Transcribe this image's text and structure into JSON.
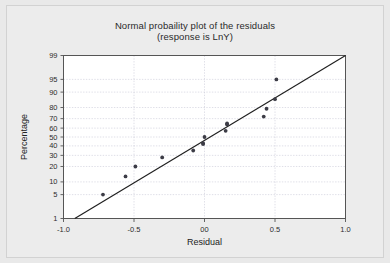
{
  "figure": {
    "background_color": "#e9e9e9",
    "plot_background_color": "#ffffff",
    "frame_color": "#555555",
    "grid_color": "#c9c9d6",
    "marker_color": "#3c3c46",
    "line_color": "#1f1f1f"
  },
  "chart_data": {
    "type": "scatter",
    "title": "Normal probaility plot of the residuals",
    "subtitle": "(response is LnY)",
    "xlabel": "Residual",
    "ylabel": "Percentage",
    "xlim": [
      -1.0,
      1.0
    ],
    "ylim": [
      1,
      99
    ],
    "yscale": "normal-probability",
    "grid": true,
    "legend": "none",
    "xticks": [
      -1.0,
      -0.5,
      0.0,
      0.5,
      1.0
    ],
    "xticklabels": [
      "-1.0",
      "-0.5",
      "00",
      "0.5",
      "1.0"
    ],
    "yticks": [
      1,
      5,
      10,
      20,
      30,
      40,
      50,
      60,
      70,
      80,
      90,
      95,
      99
    ],
    "yticklabels": [
      "1",
      "5",
      "10",
      "20",
      "30",
      "40",
      "50",
      "60",
      "70",
      "80",
      "90",
      "95",
      "99"
    ],
    "x": [
      -0.72,
      -0.56,
      -0.49,
      -0.3,
      -0.08,
      -0.01,
      -0.01,
      0.0,
      0.15,
      0.16,
      0.16,
      0.42,
      0.44,
      0.5,
      0.51
    ],
    "y": [
      5,
      13,
      20,
      28,
      35,
      42,
      43,
      50,
      57,
      64,
      65,
      72,
      79,
      86,
      95
    ],
    "series": [
      {
        "name": "residual-points",
        "points": [
          {
            "x": -0.72,
            "y": 5
          },
          {
            "x": -0.56,
            "y": 13
          },
          {
            "x": -0.49,
            "y": 20
          },
          {
            "x": -0.3,
            "y": 28
          },
          {
            "x": -0.08,
            "y": 35
          },
          {
            "x": -0.01,
            "y": 42
          },
          {
            "x": -0.01,
            "y": 43
          },
          {
            "x": 0.0,
            "y": 50
          },
          {
            "x": 0.15,
            "y": 57
          },
          {
            "x": 0.16,
            "y": 64
          },
          {
            "x": 0.16,
            "y": 65
          },
          {
            "x": 0.42,
            "y": 72
          },
          {
            "x": 0.44,
            "y": 79
          },
          {
            "x": 0.5,
            "y": 86
          },
          {
            "x": 0.51,
            "y": 95
          }
        ]
      }
    ],
    "reference_line": {
      "name": "normal-fit-line",
      "x_start": -0.92,
      "y_start": 1,
      "x_end": 1.0,
      "y_end": 99
    }
  }
}
